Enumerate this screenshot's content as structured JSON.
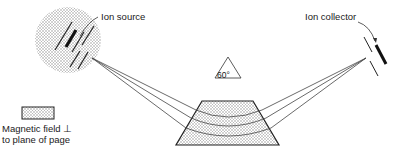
{
  "diagram": {
    "labels": {
      "ion_source": "Ion source",
      "ion_collector": "Ion collector",
      "angle": "60°",
      "legend_line1": "Magnetic field ⊥",
      "legend_line2": "to plane of page"
    },
    "components": [
      {
        "id": "ion-source",
        "shape": "stippled circle with slits"
      },
      {
        "id": "magnet",
        "shape": "stippled trapezoid (sector magnet)"
      },
      {
        "id": "ion-collector",
        "shape": "slit and collector plate"
      },
      {
        "id": "ion-beams",
        "count": 3,
        "shape": "diverging/converging lines curved through magnet"
      }
    ],
    "colors": {
      "line": "#333333",
      "stipple": "#8a8a8a",
      "background": "#ffffff"
    }
  }
}
